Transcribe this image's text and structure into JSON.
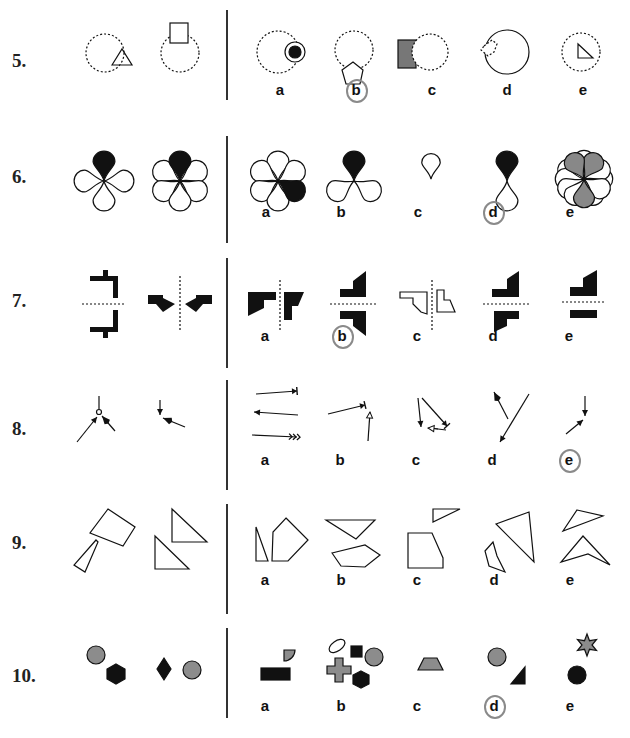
{
  "colors": {
    "ink": "#111111",
    "gray": "#8c8c8c",
    "pencil": "#8a8a8a"
  },
  "rows": [
    {
      "id": "q5",
      "number": "5.",
      "top": 0,
      "height": 120,
      "num_y": 62,
      "divider": [
        10,
        100
      ],
      "options": [
        {
          "label": "a",
          "x": 280,
          "y": 90
        },
        {
          "label": "b",
          "x": 356,
          "y": 90,
          "marked": true
        },
        {
          "label": "c",
          "x": 432,
          "y": 90
        },
        {
          "label": "d",
          "x": 507,
          "y": 90
        },
        {
          "label": "e",
          "x": 583,
          "y": 90
        }
      ],
      "shapes": [
        {
          "t": "circle",
          "cx": 105,
          "cy": 53,
          "r": 19,
          "dash": true
        },
        {
          "t": "poly",
          "pts": "112,65 122,49 132,65",
          "fill": "none"
        },
        {
          "t": "circle",
          "cx": 180,
          "cy": 53,
          "r": 19,
          "dash": true
        },
        {
          "t": "rect",
          "x": 170,
          "y": 23,
          "w": 18,
          "h": 20,
          "fill": "#fff"
        },
        {
          "t": "circle",
          "cx": 278,
          "cy": 52,
          "r": 21,
          "dash": true
        },
        {
          "t": "circle",
          "cx": 295,
          "cy": 52,
          "r": 10,
          "fill": "#fff"
        },
        {
          "t": "circle",
          "cx": 295,
          "cy": 52,
          "r": 6,
          "fill": "#111"
        },
        {
          "t": "circle",
          "cx": 354,
          "cy": 50,
          "r": 19,
          "dash": true
        },
        {
          "t": "poly",
          "pts": "353,62 363,70 360,84 346,84 342,70",
          "fill": "#fff"
        },
        {
          "t": "rect",
          "x": 398,
          "y": 40,
          "w": 18,
          "h": 28,
          "fill": "#777"
        },
        {
          "t": "circle",
          "cx": 430,
          "cy": 52,
          "r": 18,
          "dash": true,
          "fill": "#fff"
        },
        {
          "t": "circle",
          "cx": 507,
          "cy": 52,
          "r": 22
        },
        {
          "t": "poly",
          "pts": "484,46 492,40 497,44 494,52 488,56 481,50",
          "fill": "#fff",
          "dash": true
        },
        {
          "t": "circle",
          "cx": 581,
          "cy": 52,
          "r": 19,
          "dash": true
        },
        {
          "t": "poly",
          "pts": "578,44 578,58 593,58",
          "fill": "none"
        }
      ]
    },
    {
      "id": "q6",
      "number": "6.",
      "top": 120,
      "height": 120,
      "num_y": 58,
      "divider": [
        16,
        123
      ],
      "options": [
        {
          "label": "a",
          "x": 266,
          "y": 92
        },
        {
          "label": "b",
          "x": 341,
          "y": 92
        },
        {
          "label": "c",
          "x": 418,
          "y": 92
        },
        {
          "label": "d",
          "x": 493,
          "y": 92,
          "marked": true
        },
        {
          "label": "e",
          "x": 570,
          "y": 92
        }
      ],
      "shapes": [
        {
          "t": "petals",
          "cx": 104,
          "cy": 61,
          "angles": [
            90,
            180,
            0,
            270
          ],
          "fills": [
            "#111",
            "none",
            "none",
            "none"
          ],
          "len": 26
        },
        {
          "t": "petals",
          "cx": 180,
          "cy": 61,
          "angles": [
            90,
            30,
            150,
            210,
            330,
            270
          ],
          "fills": [
            "#111",
            "none",
            "none",
            "none",
            "none",
            "none"
          ],
          "len": 26
        },
        {
          "t": "petals",
          "cx": 278,
          "cy": 61,
          "angles": [
            90,
            30,
            150,
            210,
            270,
            330
          ],
          "fills": [
            "none",
            "none",
            "none",
            "none",
            "none",
            "#111"
          ],
          "len": 26
        },
        {
          "t": "petals",
          "cx": 354,
          "cy": 61,
          "angles": [
            90,
            210,
            330
          ],
          "fills": [
            "#111",
            "none",
            "none"
          ],
          "len": 26
        },
        {
          "t": "petals",
          "cx": 431,
          "cy": 59,
          "angles": [
            90
          ],
          "fills": [
            "none"
          ],
          "len": 22
        },
        {
          "t": "petals",
          "cx": 507,
          "cy": 61,
          "angles": [
            90,
            270
          ],
          "fills": [
            "#111",
            "none"
          ],
          "len": 26
        },
        {
          "t": "petals",
          "cx": 584,
          "cy": 59,
          "angles": [
            0,
            30,
            60,
            90,
            120,
            150,
            180,
            210,
            240,
            270,
            300,
            330
          ],
          "fills": [
            "none",
            "none",
            "#888",
            "none",
            "#888",
            "none",
            "none",
            "none",
            "none",
            "#888",
            "none",
            "none"
          ],
          "len": 25
        }
      ]
    },
    {
      "id": "q7",
      "number": "7.",
      "top": 240,
      "height": 120,
      "num_y": 62,
      "divider": [
        18,
        128
      ],
      "options": [
        {
          "label": "a",
          "x": 265,
          "y": 96
        },
        {
          "label": "b",
          "x": 342,
          "y": 96,
          "marked": true
        },
        {
          "label": "c",
          "x": 417,
          "y": 96
        },
        {
          "label": "d",
          "x": 493,
          "y": 96
        },
        {
          "label": "e",
          "x": 569,
          "y": 96
        }
      ],
      "shapes": [
        {
          "t": "line",
          "x1": 82,
          "y1": 64,
          "x2": 126,
          "y2": 64,
          "dash": true
        },
        {
          "t": "poly",
          "pts": "90,36 103,36 103,30 108,30 108,36 118,36 118,58 113,58 113,41 90,41",
          "fill": "#111",
          "stroke": "none"
        },
        {
          "t": "poly",
          "pts": "90,87 113,87 113,70 118,70 118,92 108,92 108,98 103,98 103,92 90,92",
          "fill": "#111",
          "stroke": "none"
        },
        {
          "t": "line",
          "x1": 180,
          "y1": 36,
          "x2": 180,
          "y2": 92,
          "dash": true
        },
        {
          "t": "poly",
          "pts": "148,55 163,55 163,58 175,64 163,72 156,64 148,64",
          "fill": "#111",
          "stroke": "none"
        },
        {
          "t": "poly",
          "pts": "212,55 196,55 196,58 185,64 196,72 203,64 212,64",
          "fill": "#111",
          "stroke": "none"
        },
        {
          "t": "line",
          "x1": 280,
          "y1": 40,
          "x2": 280,
          "y2": 92,
          "dash": true
        },
        {
          "t": "poly",
          "pts": "248,52 276,52 276,60 264,60 264,68 248,76",
          "fill": "#111",
          "stroke": "none"
        },
        {
          "t": "poly",
          "pts": "284,52 304,52 298,66 292,66 292,80 284,80",
          "fill": "#111",
          "stroke": "none"
        },
        {
          "t": "line",
          "x1": 330,
          "y1": 64,
          "x2": 376,
          "y2": 64,
          "dash": true
        },
        {
          "t": "poly",
          "pts": "340,49 353,49 353,41 366,31 366,57 340,57",
          "fill": "#111",
          "stroke": "none"
        },
        {
          "t": "poly",
          "pts": "340,71 366,71 366,96 353,86 353,79 340,79",
          "fill": "#111",
          "stroke": "none"
        },
        {
          "t": "line",
          "x1": 432,
          "y1": 40,
          "x2": 432,
          "y2": 92,
          "dash": true
        },
        {
          "t": "poly",
          "pts": "400,52 427,52 427,74 421,72 413,64 413,58 400,58",
          "fill": "none"
        },
        {
          "t": "poly",
          "pts": "437,50 444,50 444,60 450,60 455,72 437,72",
          "fill": "none"
        },
        {
          "t": "line",
          "x1": 483,
          "y1": 64,
          "x2": 530,
          "y2": 64,
          "dash": true
        },
        {
          "t": "poly",
          "pts": "492,49 507,49 507,39 519,31 519,57 492,57",
          "fill": "#111",
          "stroke": "none"
        },
        {
          "t": "poly",
          "pts": "494,71 519,71 519,79 507,79 507,86 494,92",
          "fill": "#111",
          "stroke": "none"
        },
        {
          "t": "line",
          "x1": 562,
          "y1": 62,
          "x2": 604,
          "y2": 62,
          "dash": true
        },
        {
          "t": "poly",
          "pts": "570,47 583,47 583,38 597,30 597,56 570,56",
          "fill": "#111",
          "stroke": "none"
        },
        {
          "t": "rect",
          "x": 570,
          "y": 70,
          "w": 27,
          "h": 8,
          "fill": "#111",
          "stroke": "none"
        }
      ]
    },
    {
      "id": "q8",
      "number": "8.",
      "top": 360,
      "height": 130,
      "num_y": 70,
      "divider": [
        20,
        130
      ],
      "options": [
        {
          "label": "a",
          "x": 265,
          "y": 100
        },
        {
          "label": "b",
          "x": 340,
          "y": 100
        },
        {
          "label": "c",
          "x": 416,
          "y": 100
        },
        {
          "label": "d",
          "x": 492,
          "y": 100
        },
        {
          "label": "e",
          "x": 569,
          "y": 100,
          "marked": true
        }
      ],
      "shapes": [
        {
          "t": "line",
          "x1": 99,
          "y1": 36,
          "x2": 99,
          "y2": 49
        },
        {
          "t": "circle",
          "cx": 99,
          "cy": 52,
          "r": 2.5,
          "fill": "#fff"
        },
        {
          "t": "arrow",
          "x1": 77,
          "y1": 82,
          "x2": 97,
          "y2": 57,
          "head": "tri"
        },
        {
          "t": "arrow",
          "x1": 115,
          "y1": 71,
          "x2": 102,
          "y2": 56,
          "head": "fill"
        },
        {
          "t": "arrow",
          "x1": 160,
          "y1": 40,
          "x2": 160,
          "y2": 55,
          "head": "tri"
        },
        {
          "t": "arrow",
          "x1": 185,
          "y1": 67,
          "x2": 163,
          "y2": 58,
          "head": "fill"
        },
        {
          "t": "arrow",
          "x1": 256,
          "y1": 34,
          "x2": 297,
          "y2": 31,
          "head": "bar"
        },
        {
          "t": "arrow",
          "x1": 298,
          "y1": 55,
          "x2": 254,
          "y2": 52,
          "head": "tri"
        },
        {
          "t": "arrow",
          "x1": 252,
          "y1": 75,
          "x2": 297,
          "y2": 77,
          "head": "chev"
        },
        {
          "t": "arrow",
          "x1": 328,
          "y1": 54,
          "x2": 365,
          "y2": 45,
          "head": "bar"
        },
        {
          "t": "arrow",
          "x1": 368,
          "y1": 81,
          "x2": 370,
          "y2": 52,
          "head": "open"
        },
        {
          "t": "arrow",
          "x1": 418,
          "y1": 38,
          "x2": 421,
          "y2": 67,
          "head": "tri"
        },
        {
          "t": "arrow",
          "x1": 422,
          "y1": 38,
          "x2": 447,
          "y2": 66,
          "head": "bar"
        },
        {
          "t": "line",
          "x1": 430,
          "y1": 68,
          "x2": 446,
          "y2": 70
        },
        {
          "t": "arrow",
          "x1": 438,
          "y1": 69,
          "x2": 428,
          "y2": 68,
          "head": "open"
        },
        {
          "t": "arrow",
          "x1": 508,
          "y1": 59,
          "x2": 494,
          "y2": 32,
          "head": "fill"
        },
        {
          "t": "arrow",
          "x1": 529,
          "y1": 34,
          "x2": 500,
          "y2": 82,
          "head": "tri"
        },
        {
          "t": "arrow",
          "x1": 585,
          "y1": 36,
          "x2": 585,
          "y2": 56,
          "head": "tri"
        },
        {
          "t": "arrow",
          "x1": 566,
          "y1": 74,
          "x2": 583,
          "y2": 60,
          "head": "tri"
        }
      ]
    },
    {
      "id": "q9",
      "number": "9.",
      "top": 480,
      "height": 120,
      "num_y": 64,
      "divider": [
        24,
        134
      ],
      "options": [
        {
          "label": "a",
          "x": 265,
          "y": 100
        },
        {
          "label": "b",
          "x": 341,
          "y": 100
        },
        {
          "label": "c",
          "x": 417,
          "y": 100
        },
        {
          "label": "d",
          "x": 494,
          "y": 100
        },
        {
          "label": "e",
          "x": 570,
          "y": 100
        }
      ],
      "shapes": [
        {
          "t": "poly",
          "pts": "108,29 135,47 123,66 90,53",
          "fill": "none"
        },
        {
          "t": "poly",
          "pts": "96,60 98,62 85,92 74,85",
          "fill": "none"
        },
        {
          "t": "poly",
          "pts": "172,29 207,62 172,62",
          "fill": "none"
        },
        {
          "t": "poly",
          "pts": "155,56 189,89 155,89",
          "fill": "none"
        },
        {
          "t": "poly",
          "pts": "256,47 268,81 256,81",
          "fill": "none"
        },
        {
          "t": "poly",
          "pts": "286,38 308,60 288,81 272,81 273,52",
          "fill": "none"
        },
        {
          "t": "poly",
          "pts": "326,40 375,40 356,59",
          "fill": "none"
        },
        {
          "t": "poly",
          "pts": "332,73 365,65 380,75 365,87 341,86",
          "fill": "none"
        },
        {
          "t": "poly",
          "pts": "433,29 460,29 433,42",
          "fill": "none"
        },
        {
          "t": "poly",
          "pts": "408,53 432,53 443,78 443,88 408,88",
          "fill": "none"
        },
        {
          "t": "poly",
          "pts": "496,44 529,32 534,82",
          "fill": "none"
        },
        {
          "t": "poly",
          "pts": "493,62 497,76 505,92 489,86 485,71",
          "fill": "none"
        },
        {
          "t": "poly",
          "pts": "577,30 603,36 563,51",
          "fill": "none"
        },
        {
          "t": "poly",
          "pts": "583,56 610,85 588,74 561,82",
          "fill": "none"
        }
      ]
    },
    {
      "id": "q10",
      "number": "10.",
      "top": 600,
      "height": 138,
      "num_y": 77,
      "divider": [
        28,
        118
      ],
      "options": [
        {
          "label": "a",
          "x": 265,
          "y": 106
        },
        {
          "label": "b",
          "x": 341,
          "y": 106
        },
        {
          "label": "c",
          "x": 417,
          "y": 106
        },
        {
          "label": "d",
          "x": 494,
          "y": 106,
          "marked": true
        },
        {
          "label": "e",
          "x": 570,
          "y": 106
        }
      ],
      "shapes": [
        {
          "t": "circle",
          "cx": 96,
          "cy": 55,
          "r": 9,
          "fill": "#8c8c8c"
        },
        {
          "t": "poly",
          "pts": "116,64 125,69 125,79 116,84 107,79 107,69",
          "fill": "#111"
        },
        {
          "t": "poly",
          "pts": "164,58 171,69 164,80 157,69",
          "fill": "#111"
        },
        {
          "t": "circle",
          "cx": 192,
          "cy": 70,
          "r": 9,
          "fill": "#8c8c8c"
        },
        {
          "t": "path",
          "d": "M284,50 L295,50 A11,11 0 0 1 284,61 Z",
          "fill": "#8c8c8c"
        },
        {
          "t": "rect",
          "x": 261,
          "y": 68,
          "w": 29,
          "h": 12,
          "fill": "#111"
        },
        {
          "t": "ellipse",
          "cx": 337,
          "cy": 46,
          "rx": 9,
          "ry": 5,
          "rot": -35,
          "fill": "none"
        },
        {
          "t": "rect",
          "x": 351,
          "y": 46,
          "w": 11,
          "h": 11,
          "fill": "#111"
        },
        {
          "t": "circle",
          "cx": 374,
          "cy": 57,
          "r": 9,
          "fill": "#8c8c8c"
        },
        {
          "t": "path",
          "d": "M335,58 h8 v8 h8 v8 h-8 v8 h-8 v-8 h-8 v-8 h8 Z",
          "fill": "#8c8c8c"
        },
        {
          "t": "poly",
          "pts": "361,71 369,75 369,84 361,88 353,84 353,75",
          "fill": "#111"
        },
        {
          "t": "poly",
          "pts": "424,58 437,58 443,70 418,70",
          "fill": "#8c8c8c"
        },
        {
          "t": "circle",
          "cx": 497,
          "cy": 57,
          "r": 9,
          "fill": "#8c8c8c"
        },
        {
          "t": "poly",
          "pts": "525,67 525,84 511,84",
          "fill": "#111"
        },
        {
          "t": "star",
          "cx": 587,
          "cy": 45,
          "ro": 11,
          "ri": 5,
          "fill": "#8c8c8c"
        },
        {
          "t": "circle",
          "cx": 577,
          "cy": 75,
          "r": 9,
          "fill": "#111"
        }
      ]
    }
  ]
}
